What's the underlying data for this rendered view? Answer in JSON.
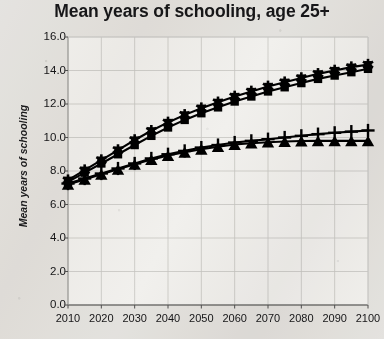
{
  "chart_data": {
    "type": "line",
    "title": "Mean years of schooling, age 25+",
    "xlabel": "",
    "ylabel": "Mean years of schooling",
    "xlim": [
      2010,
      2100
    ],
    "ylim": [
      0.0,
      16.0
    ],
    "grid": true,
    "legend": "none",
    "color": "#000000",
    "y_ticks": [
      "0.0",
      "2.0",
      "4.0",
      "6.0",
      "8.0",
      "10.0",
      "12.0",
      "14.0",
      "16.0"
    ],
    "y_tick_values": [
      0.0,
      2.0,
      4.0,
      6.0,
      8.0,
      10.0,
      12.0,
      14.0,
      16.0
    ],
    "x_ticks": [
      "2010",
      "2020",
      "2030",
      "2040",
      "2050",
      "2060",
      "2070",
      "2080",
      "2090",
      "2100"
    ],
    "x_tick_values": [
      2010,
      2020,
      2030,
      2040,
      2050,
      2060,
      2070,
      2080,
      2090,
      2100
    ],
    "x": [
      2010,
      2015,
      2020,
      2025,
      2030,
      2035,
      2040,
      2045,
      2050,
      2055,
      2060,
      2065,
      2070,
      2075,
      2080,
      2085,
      2090,
      2095,
      2100
    ],
    "series": [
      {
        "name": "Series 1",
        "marker": "asterisk",
        "values": [
          7.45,
          8.05,
          8.65,
          9.25,
          9.85,
          10.4,
          10.9,
          11.35,
          11.75,
          12.1,
          12.45,
          12.75,
          13.05,
          13.3,
          13.55,
          13.8,
          14.0,
          14.2,
          14.35
        ]
      },
      {
        "name": "Series 2",
        "marker": "square",
        "values": [
          7.35,
          7.9,
          8.45,
          9.0,
          9.55,
          10.1,
          10.6,
          11.05,
          11.45,
          11.8,
          12.15,
          12.45,
          12.75,
          13.0,
          13.25,
          13.5,
          13.7,
          13.9,
          14.1
        ]
      },
      {
        "name": "Series 3",
        "marker": "plus",
        "values": [
          7.25,
          7.55,
          7.85,
          8.15,
          8.45,
          8.75,
          9.0,
          9.2,
          9.4,
          9.55,
          9.7,
          9.8,
          9.9,
          10.0,
          10.1,
          10.2,
          10.28,
          10.35,
          10.42
        ]
      },
      {
        "name": "Series 4",
        "marker": "triangle",
        "values": [
          7.2,
          7.5,
          7.8,
          8.1,
          8.4,
          8.68,
          8.92,
          9.12,
          9.3,
          9.45,
          9.58,
          9.66,
          9.72,
          9.76,
          9.79,
          9.8,
          9.8,
          9.8,
          9.8
        ]
      }
    ]
  }
}
